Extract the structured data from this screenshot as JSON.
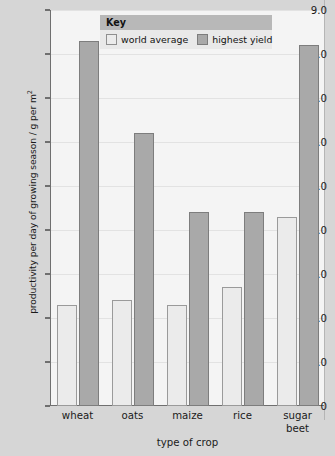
{
  "chart_data": {
    "type": "bar",
    "title": "",
    "xlabel": "type of crop",
    "ylabel": "productivity per day of growing season / g per m²",
    "ylim": [
      0,
      9.0
    ],
    "grid": true,
    "legend_position": "top-center",
    "categories": [
      "wheat",
      "oats",
      "maize",
      "rice",
      "sugar beet"
    ],
    "series": [
      {
        "name": "world average",
        "color": "#ebebeb",
        "values": [
          2.3,
          2.4,
          2.3,
          2.7,
          4.3
        ]
      },
      {
        "name": "highest yield",
        "color": "#a9a9a9",
        "values": [
          8.3,
          6.2,
          4.4,
          4.4,
          8.2
        ]
      }
    ],
    "y_ticks": [
      {
        "value": 9.0,
        "label": "9.0"
      },
      {
        "value": 8.0,
        "label": "8.0"
      },
      {
        "value": 7.0,
        "label": "7.0"
      },
      {
        "value": 6.0,
        "label": "6.0"
      },
      {
        "value": 5.0,
        "label": "5.0"
      },
      {
        "value": 4.0,
        "label": "4.0"
      },
      {
        "value": 3.0,
        "label": "3.0"
      },
      {
        "value": 2.0,
        "label": "2.0"
      },
      {
        "value": 1.0,
        "label": "1.0"
      },
      {
        "value": 0.0,
        "label": "0"
      }
    ]
  },
  "legend": {
    "title": "Key",
    "items": [
      {
        "label": "world average",
        "swatch": "world"
      },
      {
        "label": "highest yield",
        "swatch": "highest"
      }
    ]
  },
  "axis": {
    "y_title_main": "productivity per day of growing season / g per m",
    "y_title_sup": "2",
    "x_title": "type of crop"
  }
}
